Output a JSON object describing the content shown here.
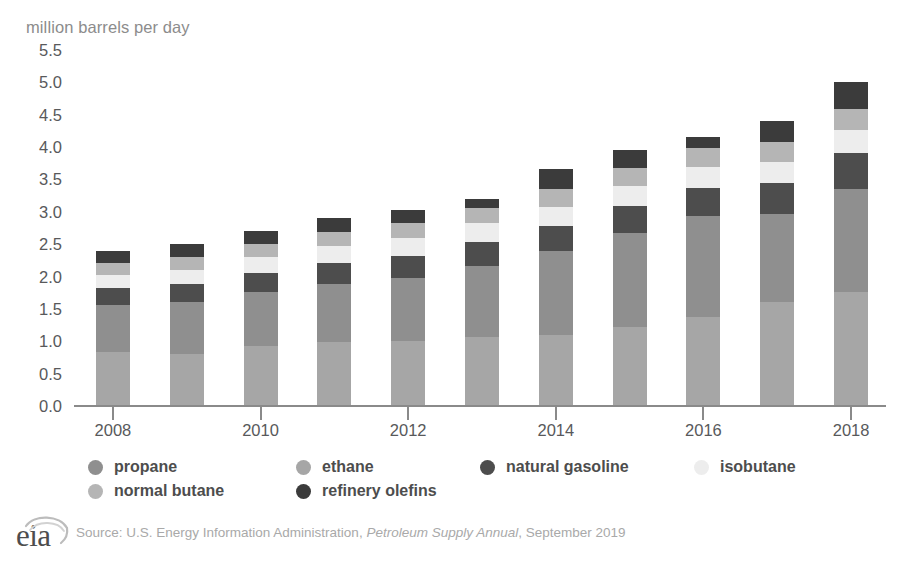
{
  "chart_data": {
    "type": "bar",
    "stacked": true,
    "title": "",
    "subtitle": "",
    "xlabel": "",
    "ylabel": "million barrels per day",
    "ylim": [
      0.0,
      5.5
    ],
    "ytick_step": 0.5,
    "grid": false,
    "legend_position": "bottom",
    "yticks": [
      "5.5",
      "5.0",
      "4.5",
      "4.0",
      "3.5",
      "3.0",
      "2.5",
      "2.0",
      "1.5",
      "1.0",
      "0.5",
      "0.0"
    ],
    "categories": [
      "2008",
      "2009",
      "2010",
      "2011",
      "2012",
      "2013",
      "2014",
      "2015",
      "2016",
      "2017",
      "2018"
    ],
    "xtick_labels": [
      "2008",
      "",
      "2010",
      "",
      "2012",
      "",
      "2014",
      "",
      "2016",
      "",
      "2018"
    ],
    "series": [
      {
        "name": "ethane",
        "color": "#a6a6a6",
        "values": [
          0.83,
          0.8,
          0.93,
          0.99,
          1.0,
          1.07,
          1.1,
          1.22,
          1.38,
          1.61,
          1.76
        ]
      },
      {
        "name": "propane",
        "color": "#8f8f8f",
        "values": [
          0.73,
          0.8,
          0.83,
          0.9,
          0.97,
          1.1,
          1.3,
          1.45,
          1.55,
          1.35,
          1.59
        ]
      },
      {
        "name": "natural gasoline",
        "color": "#4d4d4d",
        "values": [
          0.26,
          0.28,
          0.3,
          0.32,
          0.34,
          0.36,
          0.38,
          0.42,
          0.44,
          0.48,
          0.56
        ]
      },
      {
        "name": "isobutane",
        "color": "#ededed",
        "values": [
          0.2,
          0.22,
          0.24,
          0.26,
          0.28,
          0.29,
          0.3,
          0.31,
          0.32,
          0.33,
          0.35
        ]
      },
      {
        "name": "normal butane",
        "color": "#b5b5b5",
        "values": [
          0.19,
          0.2,
          0.21,
          0.22,
          0.23,
          0.24,
          0.27,
          0.28,
          0.29,
          0.31,
          0.33
        ]
      },
      {
        "name": "refinery olefins",
        "color": "#3b3b3b",
        "values": [
          0.19,
          0.2,
          0.19,
          0.21,
          0.21,
          0.14,
          0.31,
          0.27,
          0.17,
          0.32,
          0.41
        ]
      }
    ],
    "totals": [
      2.4,
      2.5,
      2.7,
      2.9,
      3.03,
      3.2,
      3.66,
      3.95,
      4.15,
      4.4,
      5.0
    ]
  },
  "legend": {
    "items": [
      {
        "label": "propane",
        "color": "#8f8f8f"
      },
      {
        "label": "ethane",
        "color": "#a6a6a6"
      },
      {
        "label": "natural gasoline",
        "color": "#4d4d4d"
      },
      {
        "label": "isobutane",
        "color": "#ededed"
      },
      {
        "label": "normal butane",
        "color": "#b5b5b5"
      },
      {
        "label": "refinery olefins",
        "color": "#3b3b3b"
      }
    ]
  },
  "footer": {
    "logo_text": "eia",
    "source_prefix": "Source: U.S. Energy Information Administration, ",
    "source_italic": "Petroleum Supply Annual",
    "source_suffix": ", September 2019"
  },
  "colors": {
    "axis": "#8a8a8a",
    "tick_text": "#58595b",
    "axis_title": "#8c8c8c",
    "source_text": "#a9a9a9",
    "background": "#ffffff"
  }
}
